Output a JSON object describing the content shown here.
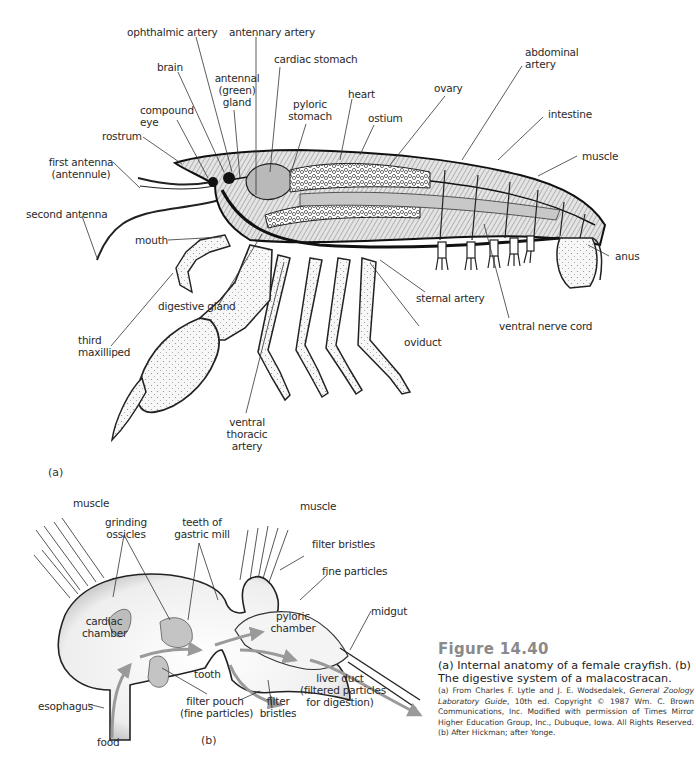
{
  "figure": {
    "number": "Figure 14.40",
    "caption": "(a) Internal anatomy of a female crayfish. (b) The digestive system of a malacostracan.",
    "source_prefix": "(a) From Charles F. Lytle and J. E. Wodsedalek, ",
    "source_title": "General Zoology Laboratory Guide",
    "source_suffix": ", 10th ed. Copyright © 1987 Wm. C. Brown Communications, Inc. Modified with permission of Times Mirror Higher Education Group, Inc., Dubuque, Iowa. All Rights Reserved. (b) After Hickman; after Yonge."
  },
  "panel_a": {
    "tag": "(a)",
    "title": "Internal anatomy of a female crayfish",
    "labels": {
      "ophthalmic_artery": "ophthalmic artery",
      "antennary_artery": "antennary artery",
      "cardiac_stomach": "cardiac stomach",
      "brain": "brain",
      "antennal_gland_1": "antennal",
      "antennal_gland_2": "(green)",
      "antennal_gland_3": "gland",
      "compound_eye_1": "compound",
      "compound_eye_2": "eye",
      "pyloric_stomach_1": "pyloric",
      "pyloric_stomach_2": "stomach",
      "heart": "heart",
      "ostium": "ostium",
      "ovary": "ovary",
      "abdominal_artery_1": "abdominal",
      "abdominal_artery_2": "artery",
      "intestine": "intestine",
      "muscle": "muscle",
      "rostrum": "rostrum",
      "first_antenna_1": "first antenna",
      "first_antenna_2": "(antennule)",
      "second_antenna": "second antenna",
      "mouth": "mouth",
      "digestive_gland": "digestive gland",
      "third_maxilliped_1": "third",
      "third_maxilliped_2": "maxilliped",
      "ventral_thoracic_artery_1": "ventral",
      "ventral_thoracic_artery_2": "thoracic",
      "ventral_thoracic_artery_3": "artery",
      "sternal_artery": "sternal artery",
      "oviduct": "oviduct",
      "ventral_nerve_cord": "ventral nerve cord",
      "anus": "anus"
    }
  },
  "panel_b": {
    "tag": "(b)",
    "title": "The digestive system of a malacostracan",
    "labels": {
      "muscle_left": "muscle",
      "muscle_right": "muscle",
      "grinding_ossicles_1": "grinding",
      "grinding_ossicles_2": "ossicles",
      "teeth_1": "teeth of",
      "teeth_2": "gastric mill",
      "filter_bristles_top": "filter bristles",
      "fine_particles": "fine particles",
      "cardiac_chamber_1": "cardiac",
      "cardiac_chamber_2": "chamber",
      "pyloric_chamber_1": "pyloric",
      "pyloric_chamber_2": "chamber",
      "midgut": "midgut",
      "tooth": "tooth",
      "liver_duct_1": "liver duct",
      "liver_duct_2": "(filtered particles",
      "liver_duct_3": "for digestion)",
      "esophagus": "esophagus",
      "filter_pouch_1": "filter pouch",
      "filter_pouch_2": "(fine particles)",
      "filter_bristles_bottom_1": "filter",
      "filter_bristles_bottom_2": "bristles",
      "food": "food"
    }
  }
}
